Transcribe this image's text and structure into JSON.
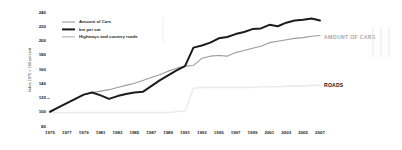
{
  "chart_data": {
    "type": "line",
    "title": "",
    "xlabel": "",
    "ylabel": "Index 1975 = 100 percent",
    "ylim": [
      80,
      240
    ],
    "xlim": [
      1975,
      2007
    ],
    "grid": false,
    "legend_position": "top-left",
    "y_ticks": [
      240,
      220,
      200,
      180,
      160,
      140,
      120,
      100,
      80
    ],
    "x_ticks": [
      1975,
      1977,
      1979,
      1981,
      1983,
      1985,
      1987,
      1989,
      1991,
      1993,
      1995,
      1997,
      1999,
      2001,
      2003,
      2005,
      2007
    ],
    "x": [
      1975,
      1976,
      1977,
      1978,
      1979,
      1980,
      1981,
      1982,
      1983,
      1984,
      1985,
      1986,
      1987,
      1988,
      1989,
      1990,
      1991,
      1992,
      1993,
      1994,
      1995,
      1996,
      1997,
      1998,
      1999,
      2000,
      2001,
      2002,
      2003,
      2004,
      2005,
      2006,
      2007
    ],
    "series": [
      {
        "name": "Amount of Cars",
        "color": "#9b9b9b",
        "width": 1.1,
        "values": [
          100,
          106,
          112,
          118,
          124,
          127,
          129,
          131,
          134,
          137,
          140,
          144,
          148,
          152,
          157,
          161,
          164,
          165,
          175,
          178,
          179,
          178,
          183,
          186,
          189,
          192,
          197,
          199,
          201,
          203,
          204,
          206,
          207
        ]
      },
      {
        "name": "km per car",
        "color": "#1c1c1c",
        "width": 2.0,
        "values": [
          100,
          106,
          112,
          118,
          124,
          127,
          123,
          118,
          122,
          125,
          127,
          128,
          136,
          144,
          151,
          158,
          164,
          190,
          193,
          197,
          203,
          205,
          209,
          212,
          216,
          217,
          222,
          220,
          225,
          228,
          229,
          231,
          228
        ]
      },
      {
        "name": "Highways and country roads",
        "color": "#ececec",
        "width": 1.6,
        "values": [
          99,
          99,
          99,
          99,
          99,
          99,
          99,
          99,
          99,
          99,
          99,
          99,
          99,
          99,
          99,
          100,
          101,
          133,
          134,
          134,
          134,
          134,
          134,
          134,
          134,
          135,
          135,
          135,
          136,
          136,
          136,
          137,
          137
        ]
      }
    ],
    "annotations": [
      {
        "text": "AMOUNT OF CARS",
        "x": 2008,
        "y": 204,
        "color": "#a8a8a8"
      },
      {
        "text": "ROADS",
        "x": 2008,
        "y": 137,
        "color": "#111111"
      }
    ]
  },
  "legend": {
    "items": [
      {
        "label": "Amount of Cars"
      },
      {
        "label": "km per car"
      },
      {
        "label": "Highways and country roads"
      }
    ]
  },
  "axis": {
    "y_title": "Index 1975 = 100 percent"
  }
}
